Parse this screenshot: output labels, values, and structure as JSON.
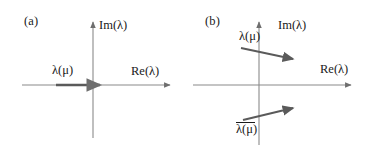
{
  "figure": {
    "background_color": "#ffffff",
    "stroke_color": "#6e6e6e",
    "text_color": "#1a1a1a",
    "width": 366,
    "height": 168
  },
  "panels": [
    {
      "tag": "(a)",
      "axes": {
        "vertical_label": "Im(λ)",
        "horizontal_label": "Re(λ)"
      },
      "arrows": [
        {
          "label": "λ(μ)",
          "description": "real-eigenvalue-arrow",
          "direction": "rightward-horizontal"
        }
      ]
    },
    {
      "tag": "(b)",
      "axes": {
        "vertical_label": "Im(λ)",
        "horizontal_label": "Re(λ)"
      },
      "arrows": [
        {
          "label": "λ(μ)",
          "description": "upper-complex-eigenvalue-arrow",
          "direction": "rightward-slanting-down"
        },
        {
          "label_base": "λ(μ)",
          "label_has_overbar": true,
          "description": "lower-conjugate-eigenvalue-arrow",
          "direction": "rightward-slanting-up"
        }
      ]
    }
  ]
}
